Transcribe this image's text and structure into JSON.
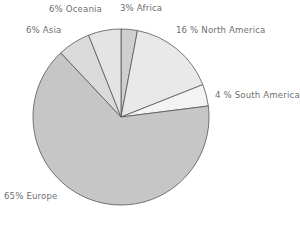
{
  "chart_data": {
    "type": "pie",
    "title": "",
    "subtitle": "",
    "xlabel": "",
    "ylabel": "",
    "legend_position": "none",
    "grid": false,
    "unit": "%",
    "total": 100,
    "start_angle_deg": 0,
    "direction": "clockwise",
    "categories": [
      "Africa",
      "North America",
      "South America",
      "Europe",
      "Asia",
      "Oceania"
    ],
    "values": [
      3,
      16,
      4,
      65,
      6,
      6
    ],
    "slices": [
      {
        "name": "Africa",
        "label": "3% Africa",
        "value": 3,
        "color": "#cfcfcf",
        "label_x": 120,
        "label_y": 4,
        "label_align": "left"
      },
      {
        "name": "North America",
        "label": "16 % North America",
        "value": 16,
        "color": "#e9e9e9",
        "label_x": 176,
        "label_y": 26,
        "label_align": "left"
      },
      {
        "name": "South America",
        "label": "4 % South America",
        "value": 4,
        "color": "#f3f3f3",
        "label_x": 215,
        "label_y": 91,
        "label_align": "left"
      },
      {
        "name": "Europe",
        "label": "65% Europe",
        "value": 65,
        "color": "#c6c6c6",
        "label_x": 4,
        "label_y": 192,
        "label_align": "left"
      },
      {
        "name": "Asia",
        "label": "6% Asia",
        "value": 6,
        "color": "#dadada",
        "label_x": 26,
        "label_y": 26,
        "label_align": "left"
      },
      {
        "name": "Oceania",
        "label": "6% Oceania",
        "value": 6,
        "color": "#e4e4e4",
        "label_x": 49,
        "label_y": 5,
        "label_align": "left"
      }
    ],
    "geometry": {
      "center_x": 121,
      "center_y": 117,
      "radius": 88
    },
    "style": {
      "background": "#ffffff",
      "slice_border": "#555555",
      "label_color": "#6f6f6f"
    }
  }
}
